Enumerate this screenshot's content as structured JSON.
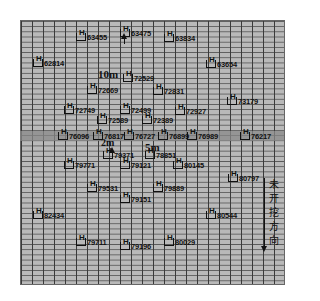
{
  "title": "",
  "grid": {
    "x": 20,
    "y": 20,
    "width": 263,
    "height": 263,
    "fill": "#b9b9b9",
    "line_color": "#3a3a3a"
  },
  "band": {
    "y": 131,
    "height": 10,
    "color": "#8a8a8a"
  },
  "points": [
    {
      "id": "63455",
      "x": 76,
      "y": 32
    },
    {
      "id": "63475",
      "x": 120,
      "y": 28
    },
    {
      "id": "63834",
      "x": 164,
      "y": 33
    },
    {
      "id": "62814",
      "x": 33,
      "y": 58
    },
    {
      "id": "63654",
      "x": 206,
      "y": 59
    },
    {
      "id": "72529",
      "x": 123,
      "y": 73
    },
    {
      "id": "72669",
      "x": 87,
      "y": 85
    },
    {
      "id": "72831",
      "x": 153,
      "y": 86
    },
    {
      "id": "73179",
      "x": 227,
      "y": 96
    },
    {
      "id": "72749",
      "x": 64,
      "y": 105
    },
    {
      "id": "72499",
      "x": 120,
      "y": 105
    },
    {
      "id": "72927",
      "x": 175,
      "y": 106
    },
    {
      "id": "72589",
      "x": 97,
      "y": 115
    },
    {
      "id": "72389",
      "x": 142,
      "y": 115
    },
    {
      "id": "76096",
      "x": 58,
      "y": 131
    },
    {
      "id": "76817",
      "x": 93,
      "y": 131
    },
    {
      "id": "76727",
      "x": 124,
      "y": 131
    },
    {
      "id": "76899",
      "x": 158,
      "y": 131
    },
    {
      "id": "76989",
      "x": 187,
      "y": 131
    },
    {
      "id": "76217",
      "x": 240,
      "y": 131
    },
    {
      "id": "79371",
      "x": 103,
      "y": 150
    },
    {
      "id": "78851",
      "x": 145,
      "y": 150
    },
    {
      "id": "79771",
      "x": 64,
      "y": 160
    },
    {
      "id": "79121",
      "x": 120,
      "y": 160
    },
    {
      "id": "80145",
      "x": 173,
      "y": 160
    },
    {
      "id": "80797",
      "x": 228,
      "y": 173
    },
    {
      "id": "79531",
      "x": 87,
      "y": 183
    },
    {
      "id": "79889",
      "x": 153,
      "y": 183
    },
    {
      "id": "79151",
      "x": 120,
      "y": 194
    },
    {
      "id": "82434",
      "x": 33,
      "y": 210
    },
    {
      "id": "80544",
      "x": 206,
      "y": 210
    },
    {
      "id": "79711",
      "x": 76,
      "y": 237
    },
    {
      "id": "79196",
      "x": 120,
      "y": 241
    },
    {
      "id": "80029",
      "x": 164,
      "y": 237
    }
  ],
  "labels": [
    {
      "text": "10m",
      "x": 98,
      "y": 68,
      "size": 11
    },
    {
      "text": "2m",
      "x": 101,
      "y": 137,
      "size": 10
    },
    {
      "text": "5m",
      "x": 145,
      "y": 141,
      "size": 11
    }
  ],
  "arrows": [
    {
      "dir": "up",
      "x": 124,
      "y_from": 44,
      "y_to": 36
    },
    {
      "dir": "up",
      "x": 112,
      "y_from": 155,
      "y_to": 150
    },
    {
      "dir": "down",
      "x": 264,
      "y_from": 178,
      "y_to": 249
    }
  ],
  "direction_text": {
    "chars": [
      "未",
      "开",
      "挖",
      "方",
      "向"
    ],
    "meaning": "unexcavated direction"
  }
}
